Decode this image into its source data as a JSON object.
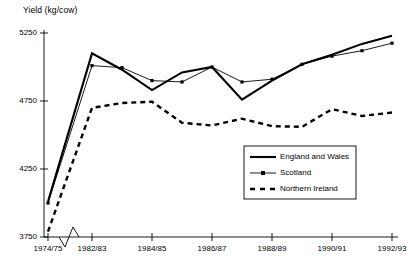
{
  "chart_data": {
    "type": "line",
    "title": "",
    "ylabel": "Yield (kg/cow)",
    "xlabel": "",
    "ylim": [
      3750,
      5250
    ],
    "yticks": [
      3750,
      4250,
      4750,
      5250
    ],
    "ytick_labels": [
      "3750",
      "4250",
      "4750",
      "5250"
    ],
    "grid": false,
    "legend_position": "inside-lower-right",
    "x_axis_break": true,
    "x_axis_break_note": "zigzag break between 1974/75 and 1982/83",
    "categories": [
      "1974/75",
      "1982/83",
      "1983/84",
      "1984/85",
      "1985/86",
      "1986/87",
      "1987/88",
      "1988/89",
      "1989/90",
      "1990/91",
      "1991/92",
      "1992/93"
    ],
    "xtick_labels": [
      "1974/75",
      "1982/83",
      "1984/85",
      "1986/87",
      "1988/89",
      "1990/91",
      "1992/93"
    ],
    "series": [
      {
        "name": "England and Wales",
        "style": "solid-thick",
        "marker": "none",
        "color": "#000000",
        "values": [
          4010,
          5100,
          4980,
          4830,
          4960,
          5000,
          4760,
          4900,
          5020,
          5090,
          5170,
          5230
        ]
      },
      {
        "name": "Scotland",
        "style": "solid-thin-marker",
        "marker": "square",
        "color": "#000000",
        "values": [
          4000,
          5010,
          4995,
          4900,
          4890,
          5000,
          4890,
          4910,
          5020,
          5080,
          5120,
          5175
        ]
      },
      {
        "name": "Northern Ireland",
        "style": "dashed",
        "marker": "none",
        "color": "#000000",
        "values": [
          3790,
          4700,
          4735,
          4745,
          4590,
          4570,
          4620,
          4565,
          4560,
          4690,
          4640,
          4665
        ]
      }
    ]
  },
  "legend": {
    "items": [
      {
        "label": "England and Wales",
        "style": "solid-thick"
      },
      {
        "label": "Scotland",
        "style": "solid-thin-marker"
      },
      {
        "label": "Northern Ireland",
        "style": "dashed"
      }
    ]
  }
}
